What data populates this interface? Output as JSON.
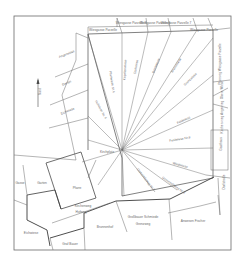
{
  "map": {
    "type": "cadastral-plan",
    "colors": {
      "background": "#ffffff",
      "line": "#5a5a5a",
      "bold_line": "#3a3a3a",
      "text": "#6a6a6a"
    },
    "top_parcels": [
      {
        "label": "Wiesgasse Parzelle",
        "x": 103,
        "y": 31
      },
      {
        "label": "Wiesgasse Parzelle 8",
        "x": 131,
        "y": 24
      },
      {
        "label": "Wiesgasse Parzelle 9",
        "x": 155,
        "y": 24
      },
      {
        "label": "Wiesgasse Parzelle 7",
        "x": 176,
        "y": 24
      },
      {
        "label": "Wiesgasse Parzelle",
        "x": 204,
        "y": 31
      }
    ],
    "left_parcels": [
      {
        "label": "Angerwiese",
        "x": 67,
        "y": 55
      },
      {
        "label": "Garten",
        "x": 67,
        "y": 84
      },
      {
        "label": "Eichwiese",
        "x": 68,
        "y": 112
      }
    ],
    "ray_parcels": [
      {
        "label": "Hofwiese Nr. 6",
        "x": 100,
        "y": 110
      },
      {
        "label": "Pfarrwiese Nr.4",
        "x": 111,
        "y": 82
      },
      {
        "label": "Kapellenwiese",
        "x": 126,
        "y": 70
      },
      {
        "label": "Dorfwiese",
        "x": 137,
        "y": 67
      },
      {
        "label": "Bachwiese",
        "x": 157,
        "y": 66
      },
      {
        "label": "Brunnwiese",
        "x": 177,
        "y": 66
      },
      {
        "label": "Grenzwiese",
        "x": 191,
        "y": 80
      },
      {
        "label": "Feldwiese",
        "x": 184,
        "y": 121
      },
      {
        "label": "Feldwiese Nr.8",
        "x": 180,
        "y": 140
      },
      {
        "label": "Weidwiese",
        "x": 180,
        "y": 166
      },
      {
        "label": "Gemeindeweg Nr.9",
        "x": 173,
        "y": 186
      },
      {
        "label": "Gemeindeweg Nr.2",
        "x": 145,
        "y": 180
      }
    ],
    "right_parcels": [
      {
        "label": "Pfarrweg Wiesgasse Parzelle",
        "x": 221,
        "y": 64
      },
      {
        "label": "Obere Wiese",
        "x": 223,
        "y": 90
      },
      {
        "label": "Kirchen-weg Angerweg",
        "x": 223,
        "y": 117
      },
      {
        "label": "Gasthaus",
        "x": 222,
        "y": 144
      },
      {
        "label": "Dorfstraße",
        "x": 225,
        "y": 182
      }
    ],
    "bottom_parcels": [
      {
        "label": "Pfarre",
        "x": 77,
        "y": 189
      },
      {
        "label": "Garten",
        "x": 42,
        "y": 184
      },
      {
        "label": "Gasse",
        "x": 20,
        "y": 184
      },
      {
        "label": "Kirchenweg",
        "x": 83,
        "y": 207
      },
      {
        "label": "Hofweg",
        "x": 81,
        "y": 213
      },
      {
        "label": "Kirchplatz",
        "x": 107,
        "y": 153
      },
      {
        "label": "Eichwiese",
        "x": 31,
        "y": 234
      },
      {
        "label": "Graf Bauer",
        "x": 70,
        "y": 245
      },
      {
        "label": "Brunnenhof",
        "x": 105,
        "y": 228
      },
      {
        "label": "Großbauer Schmiede",
        "x": 143,
        "y": 218
      },
      {
        "label": "Grenzweg",
        "x": 143,
        "y": 225
      },
      {
        "label": "Anwesen Fischer",
        "x": 193,
        "y": 222
      }
    ],
    "north_arrow": {
      "label": "Nord",
      "x": 38,
      "y": 95
    }
  }
}
